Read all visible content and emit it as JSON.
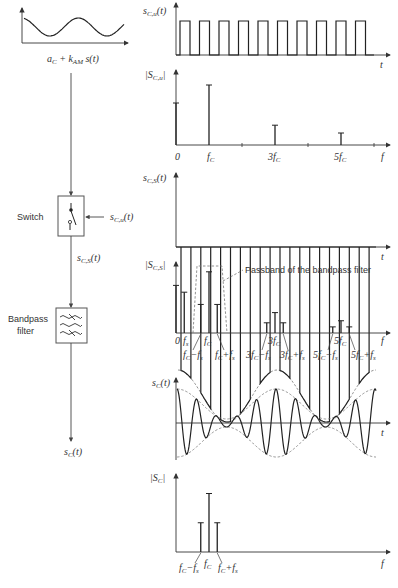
{
  "block_diagram": {
    "input_label": "a_C + k_AM s(t)",
    "switch_label": "Switch",
    "switch_control_label": "s_C,u(t)",
    "switch_output_label": "s_C,S(t)",
    "filter_label_line1": "Bandpass",
    "filter_label_line2": "filter",
    "output_label": "s_C(t)"
  },
  "panels": {
    "square_wave": {
      "ylabel": "s_C,u(t)",
      "xlabel": "t",
      "pulses": 10
    },
    "spectrum_u": {
      "ylabel": "|S_C,u|",
      "xlabel": "f",
      "tick_labels": [
        "0",
        "f_C",
        "3f_C",
        "5f_C"
      ],
      "lines": [
        {
          "f": 0,
          "amp": 0.7
        },
        {
          "f": 1,
          "amp": 1.0
        },
        {
          "f": 3,
          "amp": 0.33
        },
        {
          "f": 5,
          "amp": 0.2
        }
      ]
    },
    "sampled": {
      "ylabel": "s_C,S(t)",
      "xlabel": "t"
    },
    "spectrum_s": {
      "ylabel": "|S_C,S|",
      "xlabel": "f",
      "annotation": "Passband of the bandpass filter",
      "tick_labels": [
        "0",
        "f_s",
        "f_C",
        "f_C−f_s",
        "f_C+f_s",
        "3f_C",
        "3f_C−f_s",
        "3f_C+f_s",
        "5f_C",
        "5f_C−f_s",
        "5f_C+f_s"
      ],
      "lines": [
        {
          "f": 0,
          "amp": 0.7
        },
        {
          "f": 0.25,
          "amp": 0.6
        },
        {
          "f": 0.75,
          "amp": 0.42
        },
        {
          "f": 1,
          "amp": 0.9
        },
        {
          "f": 1.25,
          "amp": 0.42
        },
        {
          "f": 2.75,
          "amp": 0.15
        },
        {
          "f": 3,
          "amp": 0.3
        },
        {
          "f": 3.25,
          "amp": 0.15
        },
        {
          "f": 4.75,
          "amp": 0.09
        },
        {
          "f": 5,
          "amp": 0.18
        },
        {
          "f": 5.25,
          "amp": 0.09
        }
      ]
    },
    "output_time": {
      "ylabel": "s_C(t)",
      "xlabel": "t"
    },
    "output_spectrum": {
      "ylabel": "|S_C|",
      "xlabel": "f",
      "tick_labels": [
        "f_C−f_s",
        "f_C",
        "f_C+f_s"
      ],
      "lines": [
        {
          "f": 0.75,
          "amp": 0.45
        },
        {
          "f": 1,
          "amp": 0.9
        },
        {
          "f": 1.25,
          "amp": 0.45
        }
      ]
    }
  }
}
